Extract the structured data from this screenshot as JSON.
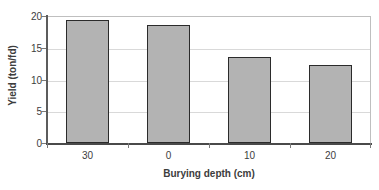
{
  "chart_data": {
    "type": "bar",
    "title": "",
    "categories": [
      "30",
      "0",
      "10",
      "20"
    ],
    "values": [
      19.4,
      18.6,
      13.5,
      12.3
    ],
    "xlabel": "Burying depth (cm)",
    "ylabel": "Yield (ton/fd)",
    "ylim": [
      0,
      20
    ],
    "yticks": [
      "0",
      "5",
      "10",
      "15",
      "20"
    ],
    "ytick_values": [
      0,
      5,
      10,
      15,
      20
    ],
    "grid": true,
    "grid_axis": "y",
    "legend": false,
    "bar_fill_color": "#b3b3b3",
    "bar_border_color": "#2b2b2b",
    "gridline_color": "#d9d9d9",
    "axis_color": "#4a4a4a",
    "plot_background": "#ffffff"
  }
}
